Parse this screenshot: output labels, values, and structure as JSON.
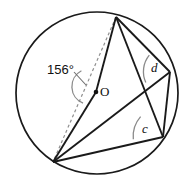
{
  "figure": {
    "type": "circle-geometry-diagram",
    "labels": {
      "central_angle": "156°",
      "center_point": "O",
      "inscribed_angle_d": "d",
      "inscribed_angle_c": "c"
    },
    "colors": {
      "stroke": "#1a1a1a",
      "arc_stroke": "#7a7a7a",
      "dashed_stroke": "#8f8f8f",
      "leader_stroke": "#6e6e6e",
      "background": "#ffffff",
      "text": "#111111"
    },
    "geometry": {
      "circle": {
        "cx": 97,
        "cy": 93,
        "r": 81
      },
      "points": {
        "O": {
          "x": 96,
          "y": 92
        },
        "T": {
          "x": 116,
          "y": 17
        },
        "B": {
          "x": 53,
          "y": 162
        },
        "D": {
          "x": 170,
          "y": 72
        },
        "C": {
          "x": 163,
          "y": 137
        }
      },
      "central_angle_value": 156,
      "dashed_chord": "T-B",
      "solid_segments": [
        "T-O",
        "O-B",
        "T-D",
        "T-C",
        "B-D",
        "B-C",
        "D-C"
      ]
    },
    "label_positions": {
      "central_angle": {
        "x": 47,
        "y": 63
      },
      "center_point": {
        "x": 100,
        "y": 85
      },
      "inscribed_angle_d": {
        "x": 151,
        "y": 61
      },
      "inscribed_angle_c": {
        "x": 142,
        "y": 122
      }
    }
  }
}
